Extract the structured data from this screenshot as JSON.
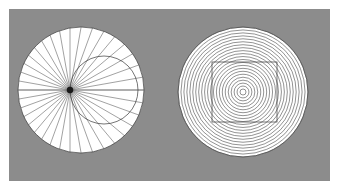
{
  "canvas": {
    "width": 339,
    "height": 190,
    "margin_color": "#ffffff"
  },
  "panel": {
    "label": "gray-background-panel",
    "x": 9,
    "y": 9,
    "width": 321,
    "height": 172,
    "fill": "#8c8c8c"
  },
  "figures": [
    {
      "id": "radial-fan-figure",
      "label": "Radial line fan in circle with secondary offset circle",
      "disc": {
        "cx": 81,
        "cy": 90,
        "r": 63,
        "fill": "#ffffff",
        "stroke": "#3a3a3a",
        "stroke_width": 0.7
      },
      "radial_lines": {
        "count": 36,
        "focus_x": 70,
        "focus_y": 90,
        "stroke": "#555555",
        "stroke_width": 0.55,
        "start_angle_deg": 0
      },
      "focus_dot": {
        "cx": 70,
        "cy": 90,
        "r": 3.2,
        "fill": "#1a1a1a"
      },
      "secondary_circle": {
        "cx": 104,
        "cy": 90,
        "r": 34,
        "fill": "none",
        "stroke": "#3a3a3a",
        "stroke_width": 0.7
      },
      "horizontal_axis": {
        "y": 90,
        "x1": 18,
        "x2": 144,
        "stroke": "#555555",
        "stroke_width": 0.55
      }
    },
    {
      "id": "concentric-rings-figure",
      "label": "Concentric circles in disc with square overlay",
      "disc": {
        "cx": 243,
        "cy": 92,
        "r": 65,
        "fill": "#ffffff",
        "stroke": "#3a3a3a",
        "stroke_width": 0.7
      },
      "rings": {
        "count": 22,
        "min_r": 3,
        "max_r": 65,
        "stroke": "#4a4a4a",
        "stroke_width": 0.6
      },
      "square_overlay": {
        "x": 212,
        "y": 62,
        "width": 65,
        "height": 60,
        "fill": "none",
        "stroke": "#3a3a3a",
        "stroke_width": 0.7
      }
    }
  ],
  "colors": {
    "background": "#8c8c8c",
    "figure_fill": "#ffffff",
    "line_dark": "#3a3a3a",
    "line_mid": "#555555",
    "focus_dot": "#1a1a1a"
  }
}
